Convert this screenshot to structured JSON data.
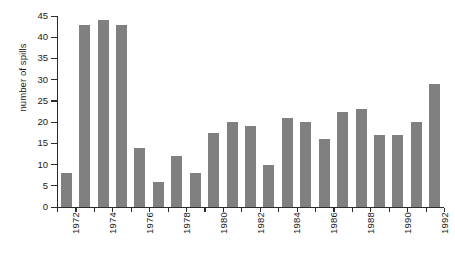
{
  "chart_data": {
    "type": "bar",
    "title": "",
    "xlabel": "",
    "ylabel": "number of spills",
    "ylim": [
      0,
      45
    ],
    "ytick_step": 5,
    "yticks": [
      0,
      5,
      10,
      15,
      20,
      25,
      30,
      35,
      40,
      45
    ],
    "grid": false,
    "legend": null,
    "bar_color": "#808080",
    "axis_color": "#2b2b2b",
    "xtick_labels_shown": [
      "1972",
      "1974",
      "1976",
      "1978",
      "1980",
      "1982",
      "1984",
      "1986",
      "1988",
      "1990",
      "1992"
    ],
    "xtick_label_rotation": -90,
    "categories": [
      "1972",
      "1973",
      "1974",
      "1975",
      "1976",
      "1977",
      "1978",
      "1979",
      "1980",
      "1981",
      "1982",
      "1983",
      "1984",
      "1985",
      "1986",
      "1987",
      "1988",
      "1989",
      "1990",
      "1991",
      "1992"
    ],
    "values": [
      8,
      43,
      44,
      43,
      14,
      6,
      12,
      8,
      17.5,
      20,
      19,
      10,
      21,
      20,
      16,
      22.5,
      23,
      17,
      17,
      20,
      29
    ]
  }
}
